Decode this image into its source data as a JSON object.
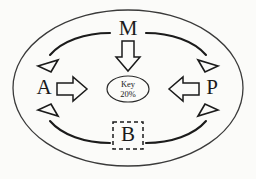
{
  "diagram": {
    "nodes": [
      {
        "id": "top",
        "label": "M",
        "position": "top"
      },
      {
        "id": "left",
        "label": "A",
        "position": "left"
      },
      {
        "id": "right",
        "label": "P",
        "position": "right"
      },
      {
        "id": "bottom",
        "label": "B",
        "position": "bottom",
        "boxed": true,
        "box_style": "dashed"
      }
    ],
    "center": {
      "label_line1": "Key",
      "label_line2": "20%",
      "shape": "ellipse"
    },
    "curved_arrows": [
      {
        "from": "M",
        "to": "A",
        "quadrant": "top-left"
      },
      {
        "from": "M",
        "to": "P",
        "quadrant": "top-right"
      },
      {
        "from": "B",
        "to": "A",
        "quadrant": "bottom-left"
      },
      {
        "from": "B",
        "to": "P",
        "quadrant": "bottom-right"
      }
    ],
    "block_arrows": [
      {
        "from": "M",
        "to": "Key",
        "direction": "down"
      },
      {
        "from": "A",
        "to": "Key",
        "direction": "right"
      },
      {
        "from": "P",
        "to": "Key",
        "direction": "left"
      }
    ],
    "colors": {
      "background": "#fbfbf9",
      "stroke": "#1b1b1b",
      "outline": "#3a3a3a",
      "text": "#1a1a1a"
    }
  }
}
